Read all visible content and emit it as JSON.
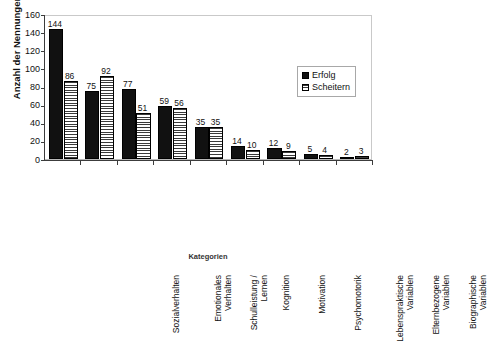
{
  "chart_data": {
    "type": "bar",
    "title": "",
    "xlabel": "Kategorien",
    "ylabel": "Anzahl der Nennungen",
    "ylim": [
      0,
      160
    ],
    "yticks": [
      0,
      20,
      40,
      60,
      80,
      100,
      120,
      140,
      160
    ],
    "grid": false,
    "legend_position": "top-right",
    "categories": [
      "Sozialverhalten",
      "Emotionales\nVerhalten",
      "Schulleistung /\nLernen",
      "Kognition",
      "Motivation",
      "Psychomotorik",
      "Lebenspraktische\nVariablen",
      "Elternbezogene\nVariablen",
      "Biographische\nVariablen"
    ],
    "series": [
      {
        "name": "Erfolg",
        "fill": "solid-black",
        "color": "#111111",
        "values": [
          144,
          75,
          77,
          59,
          35,
          14,
          12,
          5,
          2
        ]
      },
      {
        "name": "Scheitern",
        "fill": "horizontal-stripes",
        "color": "#ffffff",
        "values": [
          86,
          92,
          51,
          56,
          35,
          10,
          9,
          4,
          3
        ]
      }
    ]
  },
  "legend": {
    "items": [
      {
        "label": "Erfolg"
      },
      {
        "label": "Scheitern"
      }
    ]
  }
}
